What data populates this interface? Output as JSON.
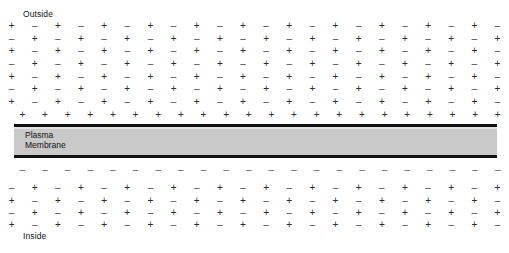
{
  "figure": {
    "background_color": "#ffffff"
  },
  "labels": {
    "outside": "Outside",
    "inside": "Inside",
    "membrane": "Plasma\nMembrane"
  },
  "membrane": {
    "fill_color": "#c9c9c9",
    "border_color": "#111111"
  },
  "charges": {
    "positive": "+",
    "negative": "–",
    "columns": 22,
    "outside_rows": [
      [
        "+",
        "–",
        "+",
        "–",
        "+",
        "–",
        "+",
        "–",
        "+",
        "–",
        "+",
        "–",
        "+",
        "–",
        "+",
        "–",
        "+",
        "–",
        "+",
        "–",
        "+",
        "–"
      ],
      [
        "–",
        "+",
        "–",
        "+",
        "–",
        "+",
        "–",
        "+",
        "–",
        "+",
        "–",
        "+",
        "–",
        "+",
        "–",
        "+",
        "–",
        "+",
        "–",
        "+",
        "–",
        "+"
      ],
      [
        "+",
        "–",
        "+",
        "–",
        "+",
        "–",
        "+",
        "–",
        "+",
        "–",
        "+",
        "–",
        "+",
        "–",
        "+",
        "–",
        "+",
        "–",
        "+",
        "–",
        "+",
        "–"
      ],
      [
        "–",
        "+",
        "–",
        "+",
        "–",
        "+",
        "–",
        "+",
        "–",
        "+",
        "–",
        "+",
        "–",
        "+",
        "–",
        "+",
        "–",
        "+",
        "–",
        "+",
        "–",
        "+"
      ],
      [
        "+",
        "–",
        "+",
        "–",
        "+",
        "–",
        "+",
        "–",
        "+",
        "–",
        "+",
        "–",
        "+",
        "–",
        "+",
        "–",
        "+",
        "–",
        "+",
        "–",
        "+",
        "–"
      ],
      [
        "–",
        "+",
        "–",
        "+",
        "–",
        "+",
        "–",
        "+",
        "–",
        "+",
        "–",
        "+",
        "–",
        "+",
        "–",
        "+",
        "–",
        "+",
        "–",
        "+",
        "–",
        "+"
      ],
      [
        "+",
        "–",
        "+",
        "–",
        "+",
        "–",
        "+",
        "–",
        "+",
        "–",
        "+",
        "–",
        "+",
        "–",
        "+",
        "–",
        "+",
        "–",
        "+",
        "–",
        "+",
        "–"
      ]
    ],
    "outer_surface_row": [
      "+",
      "+",
      "+",
      "+",
      "+",
      "+",
      "+",
      "+",
      "+",
      "+",
      "+",
      "+",
      "+",
      "+",
      "+",
      "+",
      "+",
      "+",
      "+",
      "+",
      "+",
      "+"
    ],
    "inner_surface_row": [
      "–",
      "–",
      "–",
      "–",
      "–",
      "–",
      "–",
      "–",
      "–",
      "–",
      "–",
      "–",
      "–",
      "–",
      "–",
      "–",
      "–",
      "–",
      "–",
      "–",
      "–",
      "–"
    ],
    "inside_rows": [
      [
        "–",
        "+",
        "–",
        "+",
        "–",
        "+",
        "–",
        "+",
        "–",
        "+",
        "–",
        "+",
        "–",
        "+",
        "–",
        "+",
        "–",
        "+",
        "–",
        "+",
        "–",
        "+"
      ],
      [
        "+",
        "–",
        "+",
        "–",
        "+",
        "–",
        "+",
        "–",
        "+",
        "–",
        "+",
        "–",
        "+",
        "–",
        "+",
        "–",
        "+",
        "–",
        "+",
        "–",
        "+",
        "–"
      ],
      [
        "–",
        "+",
        "–",
        "+",
        "–",
        "+",
        "–",
        "+",
        "–",
        "+",
        "–",
        "+",
        "–",
        "+",
        "–",
        "+",
        "–",
        "+",
        "–",
        "+",
        "–",
        "+"
      ],
      [
        "+",
        "–",
        "+",
        "–",
        "+",
        "–",
        "+",
        "–",
        "+",
        "–",
        "+",
        "–",
        "+",
        "–",
        "+",
        "–",
        "+",
        "–",
        "+",
        "–",
        "+",
        "–"
      ]
    ]
  }
}
